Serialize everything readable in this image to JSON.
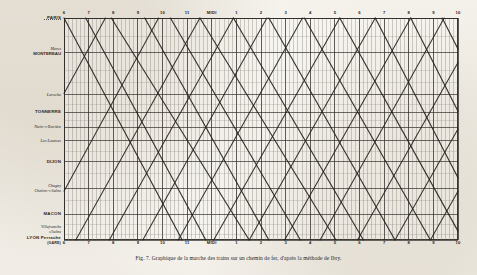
{
  "figure": {
    "caption": "Fig. 7. Graphique de la marche des trains sur un chemin de fer, d'après la méthode de Ibry.",
    "paper_color": "#f2efe9",
    "ink_color": "#2b2926",
    "frame_color": "#3a3733"
  },
  "axis": {
    "x_label_top": "",
    "x_label_bottom": "",
    "hours_top": [
      {
        "label": "6",
        "pos": 0.0
      },
      {
        "label": "7",
        "pos": 0.0625
      },
      {
        "label": "8",
        "pos": 0.125
      },
      {
        "label": "9",
        "pos": 0.1875
      },
      {
        "label": "10",
        "pos": 0.25
      },
      {
        "label": "11",
        "pos": 0.3125
      },
      {
        "label": "MIDI",
        "pos": 0.375
      },
      {
        "label": "1",
        "pos": 0.4375
      },
      {
        "label": "2",
        "pos": 0.5
      },
      {
        "label": "3",
        "pos": 0.5625
      },
      {
        "label": "4",
        "pos": 0.625
      },
      {
        "label": "5",
        "pos": 0.6875
      },
      {
        "label": "6",
        "pos": 0.75
      },
      {
        "label": "7",
        "pos": 0.8125
      },
      {
        "label": "8",
        "pos": 0.875
      },
      {
        "label": "9",
        "pos": 0.9375
      },
      {
        "label": "10",
        "pos": 1.0
      }
    ],
    "hours_bottom": [
      {
        "label": "6",
        "pos": 0.0
      },
      {
        "label": "7",
        "pos": 0.0625
      },
      {
        "label": "8",
        "pos": 0.125
      },
      {
        "label": "9",
        "pos": 0.1875
      },
      {
        "label": "10",
        "pos": 0.25
      },
      {
        "label": "11",
        "pos": 0.3125
      },
      {
        "label": "MIDI",
        "pos": 0.375
      },
      {
        "label": "1",
        "pos": 0.4375
      },
      {
        "label": "2",
        "pos": 0.5
      },
      {
        "label": "3",
        "pos": 0.5625
      },
      {
        "label": "4",
        "pos": 0.625
      },
      {
        "label": "5",
        "pos": 0.6875
      },
      {
        "label": "6",
        "pos": 0.75
      },
      {
        "label": "7",
        "pos": 0.8125
      },
      {
        "label": "8",
        "pos": 0.875
      },
      {
        "label": "9",
        "pos": 0.9375
      },
      {
        "label": "10",
        "pos": 1.0
      }
    ]
  },
  "stations": [
    {
      "name": "PARIS",
      "style": "caps",
      "pos": 0.0,
      "leader": true
    },
    {
      "name": "Maroz",
      "name2": "MONTEREAU",
      "style": "mixed",
      "pos": 0.155,
      "leader": false
    },
    {
      "name": "Laroche",
      "style": "ital",
      "pos": 0.345,
      "leader": false
    },
    {
      "name": "TONNERRE",
      "style": "caps",
      "pos": 0.425,
      "leader": false
    },
    {
      "name": "Nuits-s-Ravière",
      "style": "ital",
      "pos": 0.492,
      "leader": false
    },
    {
      "name": "Les Laumes",
      "style": "ital",
      "pos": 0.552,
      "leader": false
    },
    {
      "name": "DIJON",
      "style": "caps",
      "pos": 0.648,
      "leader": false
    },
    {
      "name": "Chagny",
      "name2": "Chalons-s-Saône",
      "style": "mixed-ital",
      "pos": 0.768,
      "leader": false
    },
    {
      "name": "MACON",
      "style": "caps",
      "pos": 0.885,
      "leader": false
    },
    {
      "name": "Villefranche",
      "name2": "s/Saône",
      "style": "mixed-ital",
      "pos": 0.952,
      "leader": false
    },
    {
      "name": "LYON Perrache",
      "name2": "(GARE)",
      "style": "caps-small",
      "pos": 1.0,
      "leader": false
    }
  ],
  "chart_data": {
    "type": "line",
    "title": "Graphique de la marche des trains",
    "xlabel": "Heures de la journée",
    "ylabel": "Stations (Paris → Lyon)",
    "x_unit": "hour",
    "x_range_hours": [
      6,
      34
    ],
    "grid": "vertical 10-minute lines, darker hourly lines; horizontal station lines",
    "legend": "none",
    "y_categories": [
      "PARIS",
      "MONTEREAU",
      "Laroche",
      "TONNERRE",
      "Nuits-s-Ravière",
      "Les Laumes",
      "DIJON",
      "Chagny / Chalons-s-Saône",
      "MACON",
      "Villefranche",
      "LYON Perrache"
    ],
    "y_positions": [
      0.0,
      0.155,
      0.345,
      0.425,
      0.492,
      0.552,
      0.648,
      0.768,
      0.885,
      1.0
    ],
    "series": [
      {
        "name": "descendant-1",
        "dir": "down",
        "points": [
          [
            0.0,
            0.0
          ],
          [
            0.3,
            1.0
          ]
        ]
      },
      {
        "name": "descendant-2",
        "dir": "down",
        "points": [
          [
            0.055,
            0.0
          ],
          [
            0.36,
            1.0
          ]
        ]
      },
      {
        "name": "descendant-3",
        "dir": "down",
        "points": [
          [
            0.12,
            0.0
          ],
          [
            0.47,
            1.0
          ]
        ]
      },
      {
        "name": "descendant-4",
        "dir": "down",
        "points": [
          [
            0.205,
            0.0
          ],
          [
            0.52,
            1.0
          ]
        ]
      },
      {
        "name": "descendant-5",
        "dir": "down",
        "points": [
          [
            0.27,
            0.0
          ],
          [
            0.6,
            1.0
          ]
        ]
      },
      {
        "name": "descendant-6",
        "dir": "down",
        "points": [
          [
            0.345,
            0.0
          ],
          [
            0.69,
            1.0
          ]
        ]
      },
      {
        "name": "descendant-7",
        "dir": "down",
        "points": [
          [
            0.43,
            0.0
          ],
          [
            0.76,
            1.0
          ]
        ]
      },
      {
        "name": "descendant-8",
        "dir": "down",
        "points": [
          [
            0.52,
            0.0
          ],
          [
            0.84,
            1.0
          ]
        ]
      },
      {
        "name": "descendant-9",
        "dir": "down",
        "points": [
          [
            0.61,
            0.0
          ],
          [
            0.93,
            1.0
          ]
        ]
      },
      {
        "name": "descendant-10",
        "dir": "down",
        "points": [
          [
            0.7,
            0.0
          ],
          [
            1.0,
            0.96
          ]
        ]
      },
      {
        "name": "descendant-11",
        "dir": "down",
        "points": [
          [
            0.79,
            0.0
          ],
          [
            1.0,
            0.72
          ]
        ]
      },
      {
        "name": "descendant-12",
        "dir": "down",
        "points": [
          [
            0.88,
            0.0
          ],
          [
            1.0,
            0.42
          ]
        ]
      },
      {
        "name": "descendant-13",
        "dir": "down",
        "points": [
          [
            0.96,
            0.0
          ],
          [
            1.0,
            0.14
          ]
        ]
      },
      {
        "name": "montant-1",
        "dir": "up",
        "points": [
          [
            0.0,
            0.34
          ],
          [
            0.105,
            0.0
          ]
        ]
      },
      {
        "name": "montant-2",
        "dir": "up",
        "points": [
          [
            0.0,
            0.78
          ],
          [
            0.24,
            0.0
          ]
        ]
      },
      {
        "name": "montant-3",
        "dir": "up",
        "points": [
          [
            0.03,
            1.0
          ],
          [
            0.345,
            0.0
          ]
        ]
      },
      {
        "name": "montant-4",
        "dir": "up",
        "points": [
          [
            0.115,
            1.0
          ],
          [
            0.43,
            0.0
          ]
        ]
      },
      {
        "name": "montant-5",
        "dir": "up",
        "points": [
          [
            0.2,
            1.0
          ],
          [
            0.515,
            0.0
          ]
        ]
      },
      {
        "name": "montant-6",
        "dir": "up",
        "points": [
          [
            0.29,
            1.0
          ],
          [
            0.605,
            0.0
          ]
        ]
      },
      {
        "name": "montant-7",
        "dir": "up",
        "points": [
          [
            0.38,
            1.0
          ],
          [
            0.7,
            0.0
          ]
        ]
      },
      {
        "name": "montant-8",
        "dir": "up",
        "points": [
          [
            0.47,
            1.0
          ],
          [
            0.79,
            0.0
          ]
        ]
      },
      {
        "name": "montant-9",
        "dir": "up",
        "points": [
          [
            0.56,
            1.0
          ],
          [
            0.88,
            0.0
          ]
        ]
      },
      {
        "name": "montant-10",
        "dir": "up",
        "points": [
          [
            0.65,
            1.0
          ],
          [
            0.965,
            0.0
          ]
        ]
      },
      {
        "name": "montant-11",
        "dir": "up",
        "points": [
          [
            0.745,
            1.0
          ],
          [
            1.0,
            0.2
          ]
        ]
      },
      {
        "name": "montant-12",
        "dir": "up",
        "points": [
          [
            0.84,
            1.0
          ],
          [
            1.0,
            0.5
          ]
        ]
      },
      {
        "name": "montant-13",
        "dir": "up",
        "points": [
          [
            0.93,
            1.0
          ],
          [
            1.0,
            0.78
          ]
        ]
      }
    ]
  }
}
